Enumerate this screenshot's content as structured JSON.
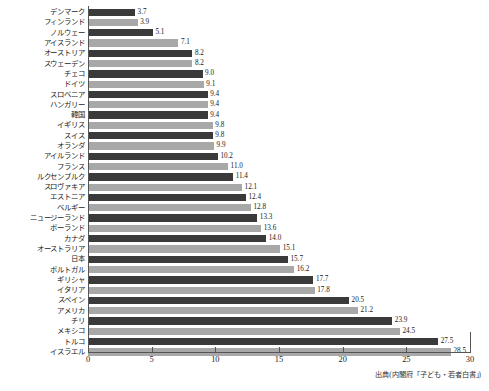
{
  "chart_data": {
    "type": "bar",
    "orientation": "horizontal",
    "title": "",
    "subtitle": "",
    "xlabel": "",
    "ylabel": "",
    "xlim": [
      0,
      30
    ],
    "xticks": [
      0,
      5,
      10,
      15,
      20,
      25,
      30
    ],
    "xtick_labels": [
      "0",
      "5",
      "10",
      "15",
      "20",
      "25",
      "30"
    ],
    "grid": false,
    "legend": "none",
    "bar_colors": {
      "dark": "#3a3a3a",
      "light": "#a8a8a8",
      "pattern": "alternating dark/light by row"
    },
    "categories": [
      "デンマーク",
      "フィンランド",
      "ノルウェー",
      "アイスランド",
      "オーストリア",
      "スウェーデン",
      "チェコ",
      "ドイツ",
      "スロベニア",
      "ハンガリー",
      "韓国",
      "イギリス",
      "スイス",
      "オランダ",
      "アイルランド",
      "フランス",
      "ルクセンブルク",
      "スロヴァキア",
      "エストニア",
      "ベルギー",
      "ニュージーランド",
      "ポーランド",
      "カナダ",
      "オーストラリア",
      "日本",
      "ポルトガル",
      "ギリシャ",
      "イタリア",
      "スペイン",
      "アメリカ",
      "チリ",
      "メキシコ",
      "トルコ",
      "イスラエル"
    ],
    "values": [
      3.7,
      3.9,
      5.1,
      7.1,
      8.2,
      8.2,
      9.0,
      9.1,
      9.4,
      9.4,
      9.4,
      9.8,
      9.8,
      9.9,
      10.2,
      11.0,
      11.4,
      12.1,
      12.4,
      12.8,
      13.3,
      13.6,
      14.0,
      15.1,
      15.7,
      16.2,
      17.7,
      17.8,
      20.5,
      21.2,
      23.9,
      24.5,
      27.5,
      28.5
    ],
    "value_labels": [
      "3.7",
      "3.9",
      "5.1",
      "7.1",
      "8.2",
      "8.2",
      "9.0",
      "9.1",
      "9.4",
      "9.4",
      "9.4",
      "9.8",
      "9.8",
      "9.9",
      "10.2",
      "11.0",
      "11.4",
      "12.1",
      "12.4",
      "12.8",
      "13.3",
      "13.6",
      "14.0",
      "15.1",
      "15.7",
      "16.2",
      "17.7",
      "17.8",
      "20.5",
      "21.2",
      "23.9",
      "24.5",
      "27.5",
      "28.5"
    ]
  },
  "source_note": "出典(内閣府「子ども・若者白書」)"
}
